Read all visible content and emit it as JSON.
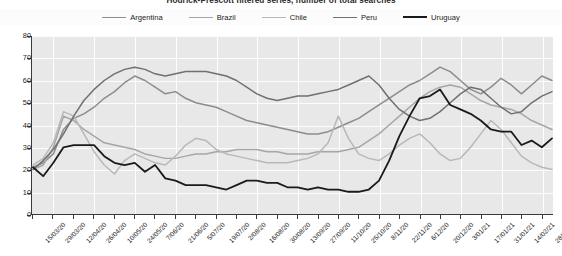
{
  "chart_data": {
    "type": "line",
    "title": "Hodrick-Prescott filtered series, number of total searches",
    "xlabel": "",
    "ylabel": "",
    "ylim": [
      0,
      80
    ],
    "ytick_step": 10,
    "yticks": [
      80,
      70,
      60,
      50,
      40,
      30,
      20,
      10,
      0
    ],
    "grid": true,
    "legend_position": "top-center",
    "legend": [
      "Argentina",
      "Brazil",
      "Chile",
      "Peru",
      "Uruguay"
    ],
    "tick_labels": [
      "15/03/20",
      "29/03/20",
      "12/04/20",
      "26/04/20",
      "10/05/20",
      "24/05/20",
      "7/06/20",
      "21/06/20",
      "5/07/20",
      "19/07/20",
      "2/08/20",
      "16/08/20",
      "30/08/20",
      "13/09/20",
      "27/09/20",
      "11/10/20",
      "25/10/20",
      "8/11/20",
      "22/11/20",
      "6/12/20",
      "20/12/20",
      "3/01/21",
      "17/01/21",
      "31/01/21",
      "14/02/21",
      "28/02/21"
    ],
    "x": [
      "15/03/20",
      "22/03/20",
      "29/03/20",
      "05/04/20",
      "12/04/20",
      "19/04/20",
      "26/04/20",
      "03/05/20",
      "10/05/20",
      "17/05/20",
      "24/05/20",
      "31/05/20",
      "07/06/20",
      "14/06/20",
      "21/06/20",
      "28/06/20",
      "05/07/20",
      "12/07/20",
      "19/07/20",
      "26/07/20",
      "02/08/20",
      "09/08/20",
      "16/08/20",
      "23/08/20",
      "30/08/20",
      "06/09/20",
      "13/09/20",
      "20/09/20",
      "27/09/20",
      "04/10/20",
      "11/10/20",
      "18/10/20",
      "25/10/20",
      "01/11/20",
      "08/11/20",
      "15/11/20",
      "22/11/20",
      "29/11/20",
      "06/12/20",
      "13/12/20",
      "20/12/20",
      "27/12/20",
      "03/01/21",
      "10/01/21",
      "17/01/21",
      "24/01/21",
      "31/01/21",
      "07/02/21",
      "14/02/21",
      "21/02/21",
      "28/02/21",
      "07/03/21"
    ],
    "series": [
      {
        "name": "Argentina",
        "color": "#8c8c8c",
        "width": 1.5,
        "values": [
          21,
          23,
          27,
          38,
          43,
          45,
          48,
          52,
          55,
          59,
          62,
          60,
          57,
          54,
          55,
          52,
          50,
          49,
          48,
          46,
          44,
          42,
          41,
          40,
          39,
          38,
          37,
          36,
          36,
          37,
          39,
          41,
          43,
          46,
          49,
          52,
          55,
          58,
          60,
          63,
          66,
          64,
          60,
          56,
          54,
          57,
          61,
          58,
          54,
          58,
          62,
          60
        ]
      },
      {
        "name": "Brazil",
        "color": "#a6a6a6",
        "width": 1.5,
        "values": [
          20,
          22,
          30,
          44,
          42,
          38,
          35,
          32,
          31,
          30,
          29,
          27,
          26,
          25,
          25,
          26,
          27,
          27,
          28,
          28,
          29,
          29,
          29,
          28,
          28,
          27,
          27,
          27,
          28,
          28,
          28,
          29,
          30,
          33,
          36,
          40,
          44,
          48,
          52,
          55,
          57,
          58,
          57,
          54,
          51,
          49,
          48,
          47,
          45,
          42,
          40,
          38
        ]
      },
      {
        "name": "Chile",
        "color": "#b8b8b8",
        "width": 1.5,
        "values": [
          22,
          25,
          32,
          46,
          44,
          36,
          28,
          22,
          18,
          24,
          27,
          25,
          23,
          22,
          26,
          31,
          34,
          33,
          29,
          27,
          26,
          25,
          24,
          23,
          23,
          23,
          24,
          25,
          27,
          32,
          44,
          34,
          27,
          25,
          24,
          27,
          31,
          34,
          36,
          32,
          27,
          24,
          25,
          30,
          36,
          42,
          38,
          32,
          26,
          23,
          21,
          20
        ]
      },
      {
        "name": "Peru",
        "color": "#707070",
        "width": 1.5,
        "values": [
          20,
          24,
          29,
          36,
          44,
          51,
          56,
          60,
          63,
          65,
          66,
          65,
          63,
          62,
          63,
          64,
          64,
          64,
          63,
          62,
          60,
          57,
          54,
          52,
          51,
          52,
          53,
          53,
          54,
          55,
          56,
          58,
          60,
          62,
          58,
          52,
          47,
          44,
          42,
          43,
          46,
          50,
          54,
          57,
          56,
          52,
          48,
          45,
          46,
          50,
          53,
          55
        ]
      },
      {
        "name": "Uruguay",
        "color": "#1a1a1a",
        "width": 1.8,
        "values": [
          21,
          17,
          23,
          30,
          31,
          31,
          31,
          26,
          23,
          22,
          23,
          19,
          22,
          16,
          15,
          13,
          13,
          13,
          12,
          11,
          13,
          15,
          15,
          14,
          14,
          12,
          12,
          11,
          12,
          11,
          11,
          10,
          10,
          11,
          15,
          24,
          35,
          44,
          52,
          53,
          56,
          49,
          47,
          45,
          42,
          38,
          37,
          37,
          31,
          33,
          30,
          34
        ]
      }
    ]
  }
}
